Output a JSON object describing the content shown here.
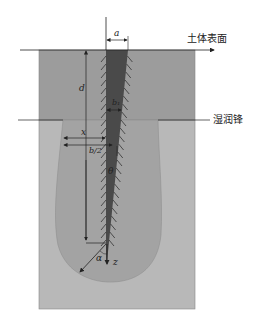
{
  "diagram": {
    "type": "soil-crack-infiltration-schematic",
    "labels": {
      "soil_surface": "土体表面",
      "wetting_front": "湿润锋",
      "crack_width_top": "a",
      "crack_width_depth": "b₁",
      "depth": "d",
      "horizontal_distance": "x",
      "half_width": "b/2",
      "crack_angle": "θ",
      "flow_angle": "α",
      "vertical_axis": "z"
    },
    "colors": {
      "upper_soil": "#9c9c9c",
      "lower_soil": "#b8b8b8",
      "wetted_bulb": "#a3a3a3",
      "crack_fill": "#4a4a4a",
      "lines": "#222222"
    }
  }
}
